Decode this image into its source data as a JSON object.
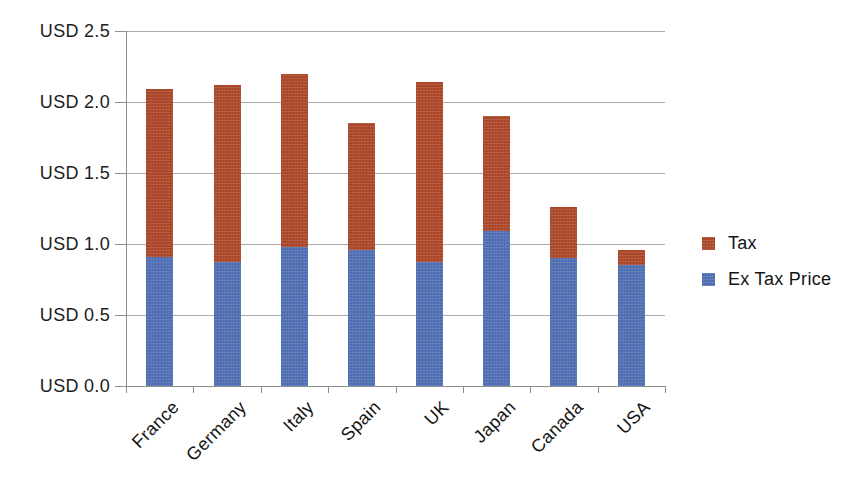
{
  "chart_data": {
    "type": "bar",
    "stacked": true,
    "title": "",
    "xlabel": "",
    "ylabel": "",
    "categories": [
      "France",
      "Germany",
      "Italy",
      "Spain",
      "UK",
      "Japan",
      "Canada",
      "USA"
    ],
    "series": [
      {
        "name": "Ex Tax Price",
        "color": "#5373b6",
        "values": [
          0.91,
          0.87,
          0.98,
          0.96,
          0.87,
          1.09,
          0.9,
          0.85
        ]
      },
      {
        "name": "Tax",
        "color": "#b04a2c",
        "values": [
          1.18,
          1.25,
          1.22,
          0.89,
          1.27,
          0.81,
          0.36,
          0.11
        ]
      }
    ],
    "totals": [
      2.09,
      2.12,
      2.2,
      1.85,
      2.14,
      1.9,
      1.26,
      0.96
    ],
    "y_ticks": [
      "USD 0.0",
      "USD 0.5",
      "USD 1.0",
      "USD 1.5",
      "USD 2.0",
      "USD 2.5"
    ],
    "y_tick_values": [
      0,
      0.5,
      1.0,
      1.5,
      2.0,
      2.5
    ],
    "ylim": [
      0,
      2.5
    ],
    "grid": true,
    "legend_position": "right",
    "legend": [
      {
        "label": "Tax",
        "color": "#b04a2c"
      },
      {
        "label": "Ex Tax Price",
        "color": "#5373b6"
      }
    ],
    "colors": {
      "gridline": "#ababab",
      "axis": "#8f8f8f",
      "text": "#1f1f1f"
    }
  }
}
